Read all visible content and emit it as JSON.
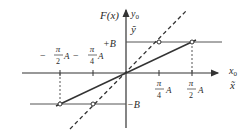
{
  "figure": {
    "type": "transfer-characteristic",
    "colors": {
      "line": "#333333",
      "background": "#ffffff"
    },
    "axes": {
      "y_label": "F(x)",
      "y_label2": "y0",
      "y_label2_main": "y",
      "y_label2_sub": "0",
      "y_label3": "ỹ",
      "x_label_main": "x",
      "x_label_sub": "0",
      "x_label2": "x̃"
    },
    "levels": {
      "plus": "+B",
      "minus": "−B"
    },
    "ticks": {
      "neg_half": {
        "sign": "−",
        "num": "π",
        "den": "2",
        "suffix": "A"
      },
      "neg_quarter": {
        "sign": "−",
        "num": "π",
        "den": "4",
        "suffix": "A"
      },
      "pos_quarter": {
        "num": "π",
        "den": "4",
        "suffix": "A"
      },
      "pos_half": {
        "num": "π",
        "den": "2",
        "suffix": "A"
      }
    },
    "curves": {
      "solid": "saturating linear F(x): slope B/(πA/2) between −πA/2 and +πA/2, clipped at ±B",
      "dashed": "unit-slope reference line y = x"
    }
  }
}
